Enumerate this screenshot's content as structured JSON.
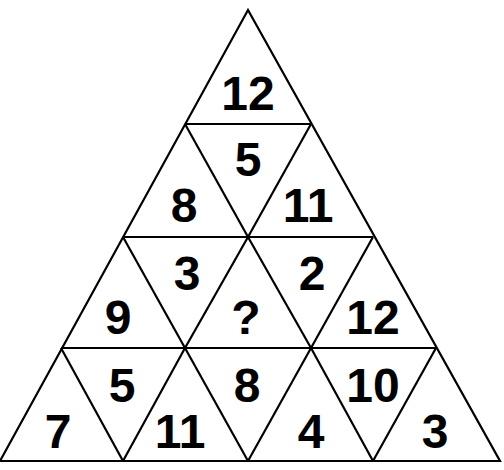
{
  "puzzle": {
    "type": "triangle number puzzle",
    "rows": [
      {
        "row": 1,
        "cells": [
          "12"
        ]
      },
      {
        "row": 2,
        "cells": [
          "8",
          "5",
          "11"
        ]
      },
      {
        "row": 3,
        "cells": [
          "9",
          "3",
          "?",
          "2",
          "12"
        ]
      },
      {
        "row": 4,
        "cells": [
          "7",
          "5",
          "11",
          "8",
          "4",
          "10",
          "3"
        ]
      }
    ]
  },
  "cells": {
    "r1c1": "12",
    "r2c1": "8",
    "r2c2": "5",
    "r2c3": "11",
    "r3c1": "9",
    "r3c2": "3",
    "r3c3": "?",
    "r3c4": "2",
    "r3c5": "12",
    "r4c1": "7",
    "r4c2": "5",
    "r4c3": "11",
    "r4c4": "8",
    "r4c5": "4",
    "r4c6": "10",
    "r4c7": "3"
  },
  "colors": {
    "line": "#000000",
    "background": "#ffffff"
  }
}
